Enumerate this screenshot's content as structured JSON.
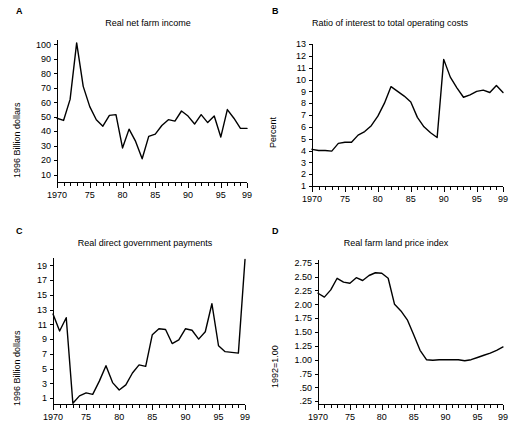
{
  "figure": {
    "background": "#ffffff",
    "line_color": "#000000",
    "axis_color": "#000000"
  },
  "panels": [
    {
      "letter": "A",
      "title": "Real net farm income",
      "ylabel": "1996 Billion dollars"
    },
    {
      "letter": "B",
      "title": "Ratio of interest to total operating costs",
      "ylabel": "Percent"
    },
    {
      "letter": "C",
      "title": "Real direct government payments",
      "ylabel": "1996 Billion dollars"
    },
    {
      "letter": "D",
      "title": "Real farm land price index",
      "ylabel": "1992=1.00"
    }
  ],
  "chart_data": [
    {
      "id": "panel-a",
      "type": "line",
      "title": "Real net farm income",
      "xlabel": "",
      "ylabel": "1996 Billion dollars",
      "xlim": [
        1970,
        1999
      ],
      "ylim": [
        5,
        103
      ],
      "ytick_values": [
        10,
        20,
        30,
        40,
        50,
        60,
        70,
        80,
        90,
        100
      ],
      "ytick_labels": [
        "10",
        "20",
        "30",
        "40",
        "50",
        "60",
        "70",
        "80",
        "90",
        "100"
      ],
      "xtick_values": [
        1970,
        1975,
        1980,
        1985,
        1990,
        1995,
        1999
      ],
      "xtick_labels": [
        "1970",
        "75",
        "80",
        "85",
        "90",
        "95",
        "99"
      ],
      "minor_xticks": true,
      "grid": false,
      "legend": false,
      "x": [
        1970,
        1971,
        1972,
        1973,
        1974,
        1975,
        1976,
        1977,
        1978,
        1979,
        1980,
        1981,
        1982,
        1983,
        1984,
        1985,
        1986,
        1987,
        1988,
        1989,
        1990,
        1991,
        1992,
        1993,
        1994,
        1995,
        1996,
        1997,
        1998,
        1999
      ],
      "values": [
        49,
        47.5,
        62,
        101,
        71,
        57,
        48,
        43.5,
        51,
        51.5,
        28.5,
        41.5,
        33,
        21,
        36.5,
        38,
        44,
        48,
        47,
        54,
        50.5,
        45,
        51.5,
        46,
        50.5,
        36,
        55,
        49,
        42,
        42
      ]
    },
    {
      "id": "panel-b",
      "type": "line",
      "title": "Ratio of interest to total operating costs",
      "xlabel": "",
      "ylabel": "Percent",
      "xlim": [
        1970,
        1999
      ],
      "ylim": [
        1,
        13
      ],
      "ytick_values": [
        1,
        2,
        3,
        4,
        5,
        6,
        7,
        8,
        9,
        10,
        11,
        12,
        13
      ],
      "ytick_labels": [
        "1",
        "2",
        "3",
        "4",
        "5",
        "6",
        "7",
        "8",
        "9",
        "10",
        "11",
        "12",
        "13"
      ],
      "xtick_values": [
        1970,
        1975,
        1980,
        1985,
        1990,
        1995,
        1999
      ],
      "xtick_labels": [
        "1970",
        "75",
        "80",
        "85",
        "90",
        "95",
        "99"
      ],
      "minor_xticks": true,
      "grid": false,
      "legend": false,
      "x": [
        1970,
        1971,
        1972,
        1973,
        1974,
        1975,
        1976,
        1977,
        1978,
        1979,
        1980,
        1981,
        1982,
        1983,
        1984,
        1985,
        1986,
        1987,
        1988,
        1989,
        1990,
        1991,
        1992,
        1993,
        1994,
        1995,
        1996,
        1997,
        1998,
        1999
      ],
      "values": [
        4.1,
        4.0,
        4.0,
        3.95,
        4.6,
        4.7,
        4.7,
        5.3,
        5.6,
        6.1,
        6.9,
        8.0,
        9.4,
        9.0,
        8.6,
        8.1,
        6.8,
        6.0,
        5.5,
        5.1,
        11.7,
        10.2,
        9.3,
        8.5,
        8.7,
        9.0,
        9.1,
        8.9,
        9.5,
        8.9
      ]
    },
    {
      "id": "panel-c",
      "type": "line",
      "title": "Real direct government payments",
      "xlabel": "",
      "ylabel": "1996 Billion dollars",
      "xlim": [
        1970,
        1999
      ],
      "ylim": [
        0.2,
        20
      ],
      "ytick_values": [
        1,
        3,
        5,
        7,
        9,
        11,
        13,
        15,
        17,
        19
      ],
      "ytick_labels": [
        "1",
        "3",
        "5",
        "7",
        "9",
        "11",
        "13",
        "15",
        "17",
        "19"
      ],
      "xtick_values": [
        1970,
        1975,
        1980,
        1985,
        1990,
        1995,
        1999
      ],
      "xtick_labels": [
        "1970",
        "75",
        "80",
        "85",
        "90",
        "95",
        "99"
      ],
      "minor_xticks": true,
      "grid": false,
      "legend": false,
      "x": [
        1970,
        1971,
        1972,
        1973,
        1974,
        1975,
        1976,
        1977,
        1978,
        1979,
        1980,
        1981,
        1982,
        1983,
        1984,
        1985,
        1986,
        1987,
        1988,
        1989,
        1990,
        1991,
        1992,
        1993,
        1994,
        1995,
        1996,
        1997,
        1998,
        1999
      ],
      "values": [
        12.4,
        10.1,
        11.9,
        0.3,
        1.3,
        1.7,
        1.5,
        3.3,
        5.4,
        3.1,
        2.1,
        2.8,
        4.4,
        5.5,
        5.3,
        9.6,
        10.4,
        10.3,
        8.4,
        8.9,
        10.4,
        10.2,
        9.0,
        10.0,
        13.8,
        8.1,
        7.3,
        7.2,
        7.1,
        19.8
      ]
    },
    {
      "id": "panel-d",
      "type": "line",
      "title": "Real farm land price index",
      "xlabel": "",
      "ylabel": "1992=1.00",
      "xlim": [
        1970,
        1999
      ],
      "ylim": [
        0.2,
        2.8
      ],
      "ytick_values": [
        0.25,
        0.5,
        0.75,
        1.0,
        1.25,
        1.5,
        1.75,
        2.0,
        2.25,
        2.5,
        2.75
      ],
      "ytick_labels": [
        ".25",
        ".50",
        ".75",
        "1.00",
        "1.25",
        "1.50",
        "1.75",
        "2.00",
        "2.25",
        "2.50",
        "2.75"
      ],
      "xtick_values": [
        1970,
        1975,
        1980,
        1985,
        1990,
        1995,
        1999
      ],
      "xtick_labels": [
        "1970",
        "75",
        "80",
        "85",
        "90",
        "95",
        "99"
      ],
      "minor_xticks": true,
      "grid": false,
      "legend": false,
      "x": [
        1970,
        1971,
        1972,
        1973,
        1974,
        1975,
        1976,
        1977,
        1978,
        1979,
        1980,
        1981,
        1982,
        1983,
        1984,
        1985,
        1986,
        1987,
        1988,
        1989,
        1990,
        1991,
        1992,
        1993,
        1994,
        1995,
        1996,
        1997,
        1998,
        1999
      ],
      "values": [
        2.2,
        2.13,
        2.26,
        2.47,
        2.4,
        2.38,
        2.48,
        2.43,
        2.52,
        2.57,
        2.56,
        2.47,
        2.0,
        1.88,
        1.72,
        1.45,
        1.17,
        1.0,
        0.99,
        1.0,
        1.0,
        1.0,
        1.0,
        0.98,
        1.0,
        1.04,
        1.08,
        1.12,
        1.17,
        1.23
      ]
    }
  ]
}
